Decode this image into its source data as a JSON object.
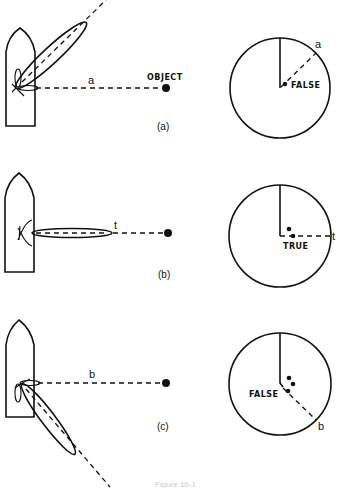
{
  "figure": {
    "caption": "Figure 10-1",
    "colors": {
      "ink": "#111111",
      "background": "#ffffff"
    }
  },
  "panels": [
    {
      "id": "a",
      "panel_label": "(a)",
      "bearing_label": "a",
      "object_label": "OBJECT",
      "scope_label": "FALSE",
      "lobe_direction": "upper-right (side lobe)",
      "scope_dots": 1
    },
    {
      "id": "b",
      "panel_label": "(b)",
      "bearing_label": "t",
      "object_label": "",
      "scope_label": "TRUE",
      "lobe_direction": "right (main lobe on target)",
      "scope_dots": 2
    },
    {
      "id": "c",
      "panel_label": "(c)",
      "bearing_label": "b",
      "object_label": "",
      "scope_label": "FALSE",
      "lobe_direction": "lower-right (side lobe)",
      "scope_dots": 3
    }
  ]
}
